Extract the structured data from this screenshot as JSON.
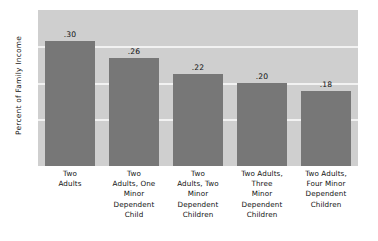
{
  "chart_data": {
    "type": "bar",
    "title": "",
    "subtitle": "",
    "xlabel": "",
    "ylabel": "Percent of Family Income",
    "categories": [
      "Two Adults",
      "Two Adults, One Minor Dependent Child",
      "Two Adults, Two Minor Dependent Children",
      "Two Adults, Three Minor Dependent Children",
      "Two Adults, Four Minor Dependent Children"
    ],
    "category_lines": [
      [
        "Two",
        "Adults"
      ],
      [
        "Two",
        "Adults, One",
        "Minor",
        "Dependent",
        "Child"
      ],
      [
        "Two",
        "Adults, Two",
        "Minor",
        "Dependent",
        "Children"
      ],
      [
        "Two Adults,",
        "Three",
        "Minor",
        "Dependent",
        "Children"
      ],
      [
        "Two Adults,",
        "Four Minor",
        "Dependent",
        "Children"
      ]
    ],
    "values": [
      0.3,
      0.26,
      0.22,
      0.2,
      0.18
    ],
    "value_labels": [
      ".30",
      ".26",
      ".22",
      ".20",
      ".18"
    ],
    "ylim": [
      0,
      0.375
    ],
    "grid": true,
    "gridlines": [
      0.0875,
      0.175,
      0.2625
    ],
    "legend": null,
    "legend_position": "none",
    "colors": {
      "bar": "#777777",
      "plot_background": "#cfcfcf",
      "gridline": "#f2f2f2",
      "text": "#111111",
      "figure_background": "#ffffff"
    }
  }
}
